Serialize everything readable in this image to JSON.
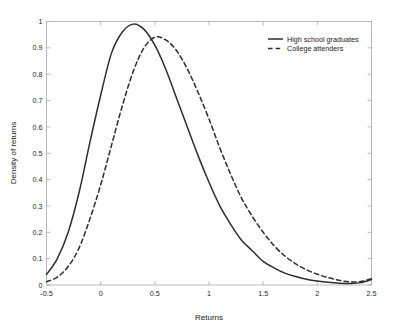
{
  "chart_data": {
    "type": "line",
    "title": "",
    "xlabel": "Returns",
    "ylabel": "Density of returns",
    "xlim": [
      -0.5,
      2.5
    ],
    "ylim": [
      0,
      1
    ],
    "grid": false,
    "legend_position": "top-right",
    "xticks": [
      -0.5,
      0,
      0.5,
      1,
      1.5,
      2,
      2.5
    ],
    "xtick_labels": [
      "-0.5",
      "0",
      "0.5",
      "1",
      "1.5",
      "2",
      "2.5"
    ],
    "yticks": [
      0,
      0.1,
      0.2,
      0.3,
      0.4,
      0.5,
      0.6,
      0.7,
      0.8,
      0.9,
      1
    ],
    "ytick_labels": [
      "0",
      "0.1",
      "0.2",
      "0.3",
      "0.4",
      "0.5",
      "0.6",
      "0.7",
      "0.8",
      "0.9",
      "1"
    ],
    "x": [
      -0.5,
      -0.4,
      -0.3,
      -0.2,
      -0.1,
      0.0,
      0.1,
      0.2,
      0.3,
      0.4,
      0.5,
      0.6,
      0.7,
      0.8,
      0.9,
      1.0,
      1.1,
      1.2,
      1.3,
      1.4,
      1.5,
      1.6,
      1.7,
      1.8,
      1.9,
      2.0,
      2.1,
      2.2,
      2.3,
      2.4,
      2.5
    ],
    "series": [
      {
        "name": "High school graduates",
        "style": "solid",
        "color": "#2e2e2e",
        "peak_x": 0.28,
        "peak_y": 0.99,
        "values": [
          0.04,
          0.1,
          0.2,
          0.35,
          0.54,
          0.72,
          0.88,
          0.96,
          0.99,
          0.97,
          0.91,
          0.82,
          0.71,
          0.6,
          0.49,
          0.39,
          0.3,
          0.23,
          0.17,
          0.13,
          0.09,
          0.065,
          0.045,
          0.032,
          0.022,
          0.015,
          0.01,
          0.007,
          0.006,
          0.009,
          0.021
        ]
      },
      {
        "name": "College attenders",
        "style": "dashed",
        "color": "#2e2e2e",
        "peak_x": 0.45,
        "peak_y": 0.94,
        "values": [
          0.012,
          0.03,
          0.07,
          0.14,
          0.25,
          0.38,
          0.53,
          0.68,
          0.81,
          0.9,
          0.94,
          0.93,
          0.89,
          0.82,
          0.73,
          0.63,
          0.52,
          0.42,
          0.33,
          0.26,
          0.2,
          0.15,
          0.11,
          0.08,
          0.058,
          0.041,
          0.028,
          0.018,
          0.012,
          0.013,
          0.024
        ]
      }
    ]
  },
  "legend": {
    "items": [
      {
        "label": "High school graduates",
        "style": "solid"
      },
      {
        "label": "College attenders",
        "style": "dashed"
      }
    ]
  },
  "axes": {
    "x_title": "Returns",
    "y_title": "Density of returns"
  }
}
